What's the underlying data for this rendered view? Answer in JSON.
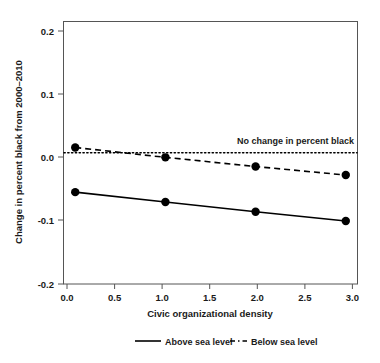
{
  "chart_data": {
    "type": "line",
    "title": "",
    "xlabel": "Civic organizational density",
    "ylabel": "Change in percent black from 2000–2010",
    "xlim": [
      -0.13,
      3.13
    ],
    "ylim": [
      -0.2,
      0.2
    ],
    "grid": false,
    "x": [
      0.0,
      1.0,
      2.0,
      3.0
    ],
    "xticks": [
      "0.0",
      "0.5",
      "1.0",
      "1.5",
      "2.0",
      "2.5",
      "3.0"
    ],
    "xtick_values": [
      0.0,
      0.5,
      1.0,
      1.5,
      2.0,
      2.5,
      3.0
    ],
    "yticks": [
      "0.2",
      "0.1",
      "0.0",
      "-0.1",
      "-0.2"
    ],
    "ytick_values": [
      0.2,
      0.1,
      0.0,
      -0.1,
      -0.2
    ],
    "series": [
      {
        "name": "Above sea level",
        "style": "solid",
        "marker": "filled-circle",
        "color": "#000000",
        "values": [
          -0.06,
          -0.075,
          -0.09,
          -0.104
        ]
      },
      {
        "name": "Below sea level",
        "style": "dashed",
        "marker": "filled-circle",
        "color": "#000000",
        "values": [
          0.008,
          -0.007,
          -0.021,
          -0.034
        ]
      }
    ],
    "reference_line": {
      "label": "No change in percent black",
      "y": 0.0,
      "style": "dotted",
      "color": "#000000"
    },
    "legend": {
      "position": "bottom",
      "entries": [
        {
          "label": "Above sea level",
          "style": "solid"
        },
        {
          "label": "Below sea level",
          "style": "dashed"
        }
      ]
    }
  }
}
